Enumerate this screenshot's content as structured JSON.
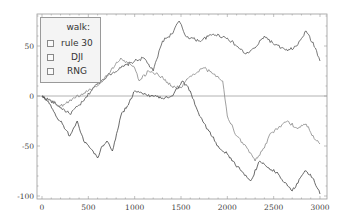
{
  "chart_data": {
    "type": "line",
    "title": "",
    "xlabel": "",
    "ylabel": "",
    "xlim": [
      -50,
      3050
    ],
    "ylim": [
      -103,
      82
    ],
    "grid": false,
    "zero_line": true,
    "legend": {
      "title": "walk:",
      "position": "upper-left",
      "entries": [
        "rule 30",
        "DJI",
        "RNG"
      ]
    },
    "x_ticks": [
      0,
      500,
      1000,
      1500,
      2000,
      2500,
      3000
    ],
    "y_ticks": [
      -100,
      -50,
      0,
      50
    ],
    "x_tick_labels": [
      "0",
      "500",
      "1000",
      "1500",
      "2000",
      "2500",
      "3000"
    ],
    "y_tick_labels": [
      "-100",
      "-50",
      "0",
      "50"
    ],
    "series": [
      {
        "name": "rule 30",
        "color": "#555555",
        "x": [
          0,
          150,
          300,
          450,
          550,
          700,
          850,
          1000,
          1100,
          1200,
          1300,
          1400,
          1480,
          1550,
          1700,
          1850,
          2000,
          2100,
          2200,
          2300,
          2400,
          2500,
          2650,
          2750,
          2850,
          2950,
          3000
        ],
        "y": [
          0,
          -8,
          -18,
          -5,
          8,
          20,
          28,
          35,
          38,
          25,
          55,
          62,
          75,
          60,
          55,
          62,
          58,
          50,
          42,
          48,
          60,
          52,
          45,
          50,
          65,
          48,
          35
        ]
      },
      {
        "name": "DJI",
        "color": "#888888",
        "x": [
          0,
          100,
          200,
          350,
          500,
          600,
          700,
          850,
          950,
          1000,
          1050,
          1150,
          1250,
          1400,
          1500,
          1600,
          1750,
          1850,
          1950,
          2000,
          2100,
          2200,
          2300,
          2400,
          2450,
          2550,
          2650,
          2750,
          2850,
          2950,
          3000
        ],
        "y": [
          0,
          -5,
          -10,
          -2,
          5,
          10,
          20,
          38,
          32,
          28,
          15,
          25,
          22,
          10,
          8,
          20,
          28,
          22,
          15,
          -20,
          -40,
          -50,
          -65,
          -52,
          -40,
          -32,
          -25,
          -32,
          -28,
          -44,
          -48
        ]
      },
      {
        "name": "RNG",
        "color": "#444444",
        "x": [
          0,
          80,
          150,
          220,
          300,
          380,
          450,
          550,
          600,
          650,
          700,
          760,
          850,
          920,
          1000,
          1100,
          1200,
          1300,
          1400,
          1520,
          1600,
          1700,
          1800,
          1900,
          2000,
          2050,
          2150,
          2250,
          2350,
          2450,
          2550,
          2650,
          2700,
          2800,
          2850,
          2920,
          3000
        ],
        "y": [
          0,
          -8,
          -20,
          -28,
          -40,
          -25,
          -45,
          -55,
          -62,
          -50,
          -45,
          -55,
          -20,
          -10,
          5,
          2,
          0,
          -2,
          0,
          15,
          5,
          -20,
          -35,
          -50,
          -58,
          -65,
          -75,
          -85,
          -65,
          -72,
          -78,
          -90,
          -95,
          -80,
          -75,
          -82,
          -98
        ]
      }
    ]
  }
}
